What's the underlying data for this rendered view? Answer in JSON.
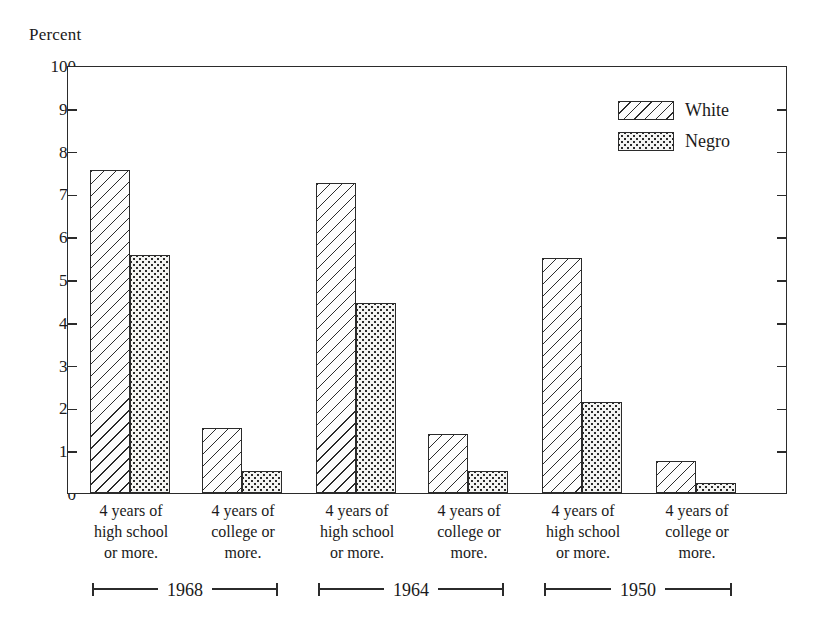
{
  "axis_title": "Percent",
  "legend": {
    "position": "top-right",
    "entries": [
      {
        "label": "White",
        "pattern": "diagonal-hatch"
      },
      {
        "label": "Negro",
        "pattern": "dotted-stipple"
      }
    ]
  },
  "y_ticks": [
    100,
    90,
    80,
    70,
    60,
    50,
    40,
    30,
    20,
    10,
    0
  ],
  "category_labels": [
    {
      "line1": "4 years of",
      "line2": "high school",
      "line3": "or more."
    },
    {
      "line1": "4 years of",
      "line2": "college or",
      "line3": "more."
    },
    {
      "line1": "4 years of",
      "line2": "high school",
      "line3": "or  more."
    },
    {
      "line1": "4 years of",
      "line2": "college or",
      "line3": "more."
    },
    {
      "line1": "4 years of",
      "line2": "high school",
      "line3": "or more."
    },
    {
      "line1": "4 years of",
      "line2": "college or",
      "line3": "more."
    }
  ],
  "year_groups": [
    "1968",
    "1964",
    "1950"
  ],
  "colors": {
    "ink": "#2b2b2b",
    "background": "#ffffff"
  },
  "chart_data": {
    "type": "bar",
    "title": "",
    "subtitle": "",
    "xlabel": "",
    "ylabel": "Percent",
    "ylim": [
      0,
      100
    ],
    "y_tick_step": 10,
    "grid": false,
    "legend_position": "top-right",
    "categories": [
      "1968 – 4 years of high school or more.",
      "1968 – 4 years of college or more.",
      "1964 – 4 years of high school or more.",
      "1964 – 4 years of college or more.",
      "1950 – 4 years of high school or more.",
      "1950 – 4 years of college or more."
    ],
    "group_years": [
      "1968",
      "1968",
      "1964",
      "1964",
      "1950",
      "1950"
    ],
    "education_levels": [
      "4 years of high school or more.",
      "4 years of college or more.",
      "4 years of high school or more.",
      "4 years of college or more.",
      "4 years of high school or more.",
      "4 years of college or more."
    ],
    "series": [
      {
        "name": "White",
        "pattern": "diagonal-hatch",
        "values": [
          75.4,
          15.2,
          72.4,
          13.8,
          54.9,
          7.4
        ]
      },
      {
        "name": "Negro",
        "pattern": "dotted-stipple",
        "values": [
          55.7,
          5.1,
          44.4,
          5.1,
          21.3,
          2.4
        ]
      }
    ]
  }
}
